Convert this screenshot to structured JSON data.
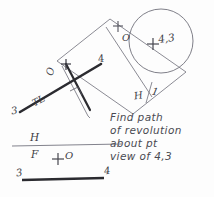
{
  "drawing": {
    "title": "Path of revolution about point view of line 3-4",
    "ink_color": "#5b5b66",
    "heavy_ink_color": "#2b2b30",
    "paper_color": "#fdfdfd",
    "note": {
      "lines": [
        "Find path",
        "of revolution",
        "about pt",
        "view of 4,3"
      ]
    },
    "labels": {
      "tl": "TL",
      "point_3_aux": "3",
      "point_4_aux": "4",
      "point_o_aux": "O",
      "point_o_circle": "O",
      "point_43": "4,3",
      "fold_h_1_h": "H",
      "fold_h_1_one": "1",
      "fold_h_f_h": "H",
      "fold_h_f_f": "F",
      "point_o_front": "O",
      "point_3_front": "3",
      "point_4_front": "4"
    },
    "marks": {
      "right_angle_symbol": "right-angle-square",
      "plus_marks": 4,
      "circle_label": "path-of-revolution-circle"
    },
    "geometry": {
      "circle": {
        "cx": 161,
        "cy": 41,
        "r": 32
      },
      "fold_h_f_line": {
        "x1": 12,
        "y1": 146,
        "x2": 122,
        "y2": 144
      },
      "front_line_34": {
        "x1": 22,
        "y1": 180,
        "x2": 104,
        "y2": 178
      }
    }
  }
}
